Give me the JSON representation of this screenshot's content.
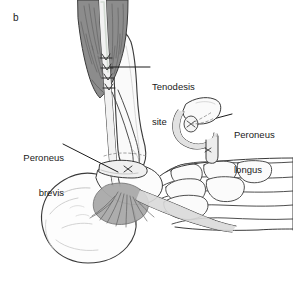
{
  "figure": {
    "panel_letter": "b",
    "background_color": "#ffffff",
    "width": 293,
    "height": 282
  },
  "labels": [
    {
      "id": "tenodesis-site",
      "line1": "Tenodesis",
      "line2": "site",
      "x": 152,
      "y": 58,
      "align": "left",
      "leader": "horizontal"
    },
    {
      "id": "peroneus-longus",
      "line1": "Peroneus",
      "line2": "longus",
      "x": 234,
      "y": 106,
      "align": "left",
      "leader": "diagonal"
    },
    {
      "id": "peroneus-brevis",
      "line1": "Peroneus",
      "line2": "brevis",
      "x": 16,
      "y": 129,
      "align": "right",
      "leader": "diagonal"
    }
  ],
  "colors": {
    "outline": "#3a3a3a",
    "muscle_belly": "#8c8c8c",
    "muscle_hatch": "#5a5a5a",
    "tendon_light": "#f4f4f4",
    "tendon_mid": "#d8d8d8",
    "bone_fill": "#fdfdfd",
    "bone_shade": "#ededed",
    "fan_gray": "#a8a8a8",
    "text": "#1a1a1a",
    "leader_line": "#1a1a1a",
    "suture": "#2a2a2a"
  },
  "anatomy": {
    "parts": [
      "peroneus-brevis-muscle-belly",
      "peroneus-brevis-tendon",
      "peroneus-longus-tendon",
      "fibula",
      "calcaneus",
      "cuboid",
      "metatarsals",
      "tendon-insertion-fan",
      "suture-knots",
      "retinaculum"
    ],
    "suture_count": 4
  }
}
